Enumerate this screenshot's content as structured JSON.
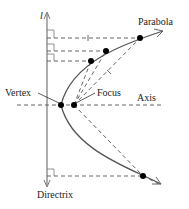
{
  "diagram": {
    "labels": {
      "directrix_symbol": "l",
      "parabola": "Parabola",
      "vertex": "Vertex",
      "focus": "Focus",
      "axis": "Axis",
      "directrix": "Directrix"
    },
    "colors": {
      "curve": "#555555",
      "dashed": "#555555",
      "point": "#000000",
      "text": "#222222"
    },
    "points": {
      "vertex": [
        61,
        105
      ],
      "focus": [
        74,
        105
      ],
      "curve_points": [
        [
          91,
          61
        ],
        [
          106,
          51
        ],
        [
          140,
          38
        ],
        [
          143,
          177
        ]
      ]
    }
  }
}
